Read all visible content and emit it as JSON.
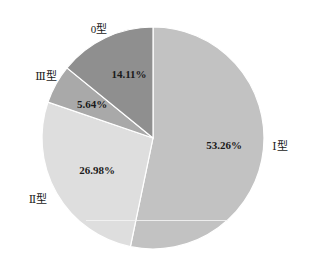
{
  "chart_data": {
    "type": "pie",
    "title": "",
    "start_angle_deg": 0,
    "direction": "clockwise",
    "center": [
      153,
      138
    ],
    "radius": 111,
    "slices": [
      {
        "name": "Ⅰ型",
        "value": 53.26,
        "label": "53.26%",
        "color": "#c2c2c2",
        "name_pos": [
          280,
          145
        ],
        "pct_pos": [
          224,
          145
        ]
      },
      {
        "name": "Ⅱ型",
        "value": 26.98,
        "label": "26.98%",
        "color": "#dedede",
        "name_pos": [
          38,
          198
        ],
        "pct_pos": [
          97,
          170
        ]
      },
      {
        "name": "Ⅲ型",
        "value": 5.64,
        "label": "5.64%",
        "color": "#a9a9a9",
        "name_pos": [
          46,
          75
        ],
        "pct_pos": [
          92,
          104
        ]
      },
      {
        "name": "0型",
        "value": 14.11,
        "label": "14.11%",
        "color": "#8f8f8f",
        "name_pos": [
          99,
          28
        ],
        "pct_pos": [
          129,
          74
        ]
      }
    ],
    "legend": "none",
    "grid": false
  }
}
